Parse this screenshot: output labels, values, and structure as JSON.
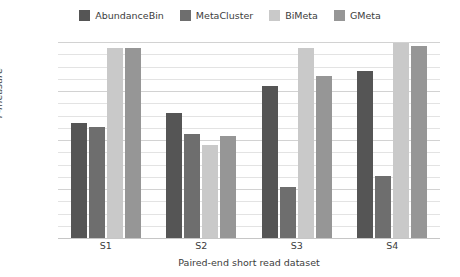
{
  "chart_data": {
    "type": "bar",
    "title": "",
    "subtitle": "",
    "xlabel": "Paired-end short read dataset",
    "ylabel": "F-measure",
    "categories": [
      "S1",
      "S2",
      "S3",
      "S4"
    ],
    "ylim": [
      0.2,
      1.0
    ],
    "yticks": [
      "0.2",
      "0.4",
      "0.6",
      "0.8",
      "1.0"
    ],
    "ytick_values": [
      0.2,
      0.4,
      0.6,
      0.8,
      1.0
    ],
    "minor_tick_step": 0.05,
    "grid": true,
    "legend_position": "top-center",
    "series": [
      {
        "name": "AbundanceBin",
        "color": "#555555",
        "values": [
          0.67,
          0.71,
          0.82,
          0.88
        ]
      },
      {
        "name": "MetaCluster",
        "color": "#6e6e6e",
        "values": [
          0.655,
          0.625,
          0.41,
          0.455
        ]
      },
      {
        "name": "BiMeta",
        "color": "#c9c9c9",
        "values": [
          0.975,
          0.58,
          0.975,
          0.995
        ]
      },
      {
        "name": "GMeta",
        "color": "#969696",
        "values": [
          0.975,
          0.615,
          0.86,
          0.985
        ]
      }
    ]
  },
  "colors": {
    "background": "#ffffff",
    "text": "#3c3c3c",
    "gridline_minor": "#e3e3e3",
    "gridline_major": "#d2d2d2",
    "baseline": "#c6c6c6"
  }
}
